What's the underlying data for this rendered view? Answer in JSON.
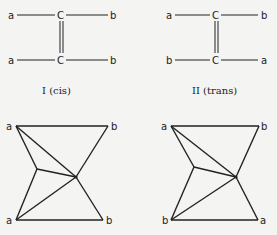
{
  "molecules": [
    {
      "caption": "I (cis)",
      "top": {
        "left": "a",
        "center": "C",
        "right": "b"
      },
      "bottom": {
        "left": "a",
        "center": "C",
        "right": "b"
      }
    },
    {
      "caption": "II (trans)",
      "top": {
        "left": "a",
        "center": "C",
        "right": "b"
      },
      "bottom": {
        "left": "b",
        "center": "C",
        "right": "a"
      }
    }
  ],
  "graphs": [
    {
      "top_left": "a",
      "top_right": "b",
      "bottom_left": "a",
      "bottom_right": "b"
    },
    {
      "top_left": "a",
      "top_right": "b",
      "bottom_left": "b",
      "bottom_right": "a"
    }
  ]
}
